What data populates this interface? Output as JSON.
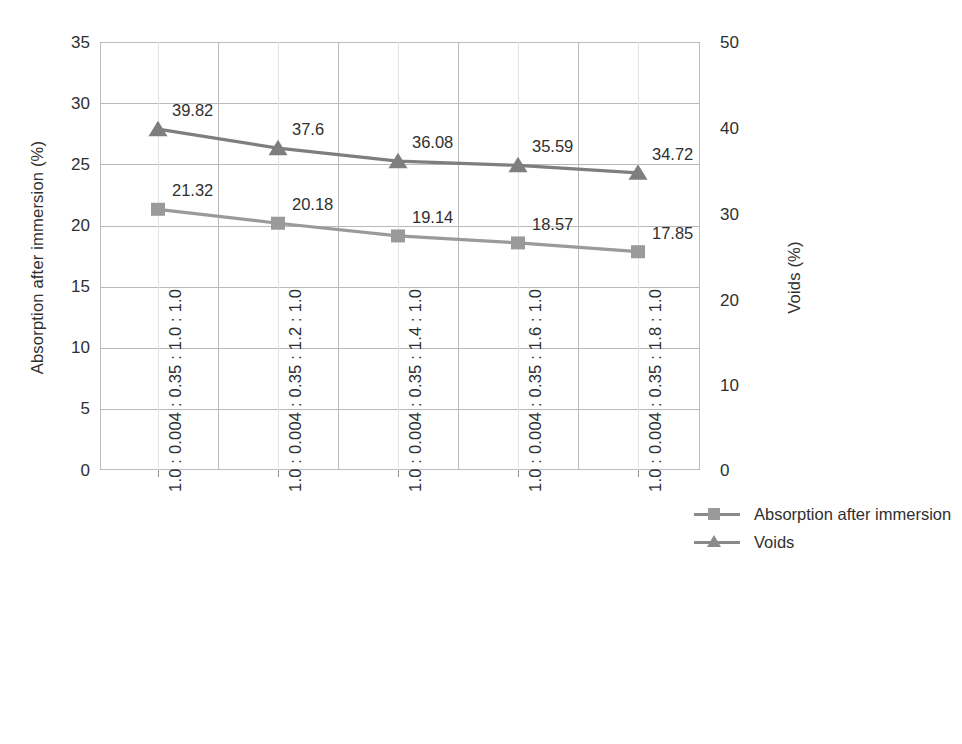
{
  "chart_data": {
    "type": "line",
    "title": "",
    "categories": [
      "1.0 : 0.004 : 0.35 : 1.0 : 1.0",
      "1.0 : 0.004 : 0.35 : 1.2 : 1.0",
      "1.0 : 0.004 : 0.35 : 1.4 : 1.0",
      "1.0 : 0.004 : 0.35 : 1.6 : 1.0",
      "1.0 : 0.004 : 0.35 : 1.8 : 1.0"
    ],
    "series": [
      {
        "name": "Absorption after immersion",
        "axis": "left",
        "marker": "square",
        "color": "#9a9a9a",
        "values": [
          21.32,
          20.18,
          19.14,
          18.57,
          17.85
        ],
        "labels": [
          "21.32",
          "20.18",
          "19.14",
          "18.57",
          "17.85"
        ]
      },
      {
        "name": "Voids",
        "axis": "right",
        "marker": "triangle",
        "color": "#7e7e7e",
        "values": [
          39.82,
          37.6,
          36.08,
          35.59,
          34.72
        ],
        "labels": [
          "39.82",
          "37.6",
          "36.08",
          "35.59",
          "34.72"
        ]
      }
    ],
    "xlabel": "",
    "ylabel": "Absorption after immersion (%)",
    "y2label": "Voids (%)",
    "ylim": [
      0,
      35
    ],
    "y2lim": [
      0,
      50
    ],
    "yticks": [
      0,
      5,
      10,
      15,
      20,
      25,
      30,
      35
    ],
    "y2ticks": [
      0,
      10,
      20,
      30,
      40,
      50
    ],
    "grid": true,
    "legend_position": "right"
  },
  "axes": {
    "left": {
      "title": "Absorption after immersion (%)",
      "ticks": [
        "35",
        "30",
        "25",
        "20",
        "15",
        "10",
        "5",
        "0"
      ]
    },
    "right": {
      "title": "Voids (%)",
      "ticks": [
        "50",
        "40",
        "30",
        "20",
        "10",
        "0"
      ]
    }
  },
  "legend": {
    "items": [
      {
        "label": "Absorption after immersion",
        "marker": "square-marker-icon"
      },
      {
        "label": "Voids",
        "marker": "triangle-marker-icon"
      }
    ]
  },
  "colors": {
    "absorption": "#9a9a9a",
    "voids": "#7e7e7e",
    "grid_major": "#b9b9b9",
    "grid_minor": "#e2e2e2",
    "text": "#2f2f2f"
  }
}
